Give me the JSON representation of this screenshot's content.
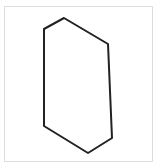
{
  "diagram": {
    "shape": "hexagon",
    "stroke_color": "#222222",
    "stroke_width": 2,
    "frame_border_color": "#dcdcdc",
    "vertices": [
      [
        64,
        18
      ],
      [
        108,
        44
      ],
      [
        112,
        138
      ],
      [
        88,
        153
      ],
      [
        44,
        126
      ],
      [
        44,
        29
      ]
    ]
  }
}
